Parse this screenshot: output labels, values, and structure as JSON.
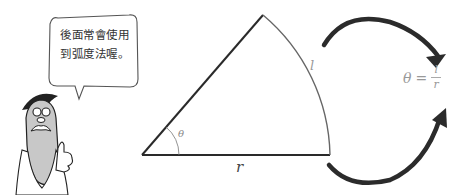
{
  "speech_bubble": {
    "line1": "後面常會使用",
    "line2": "到弧度法喔。"
  },
  "sector": {
    "angle_label": "θ",
    "arc_label": "l",
    "radius_label": "r"
  },
  "formula": {
    "lhs": "θ",
    "equals": "=",
    "numerator": "l",
    "denominator": "r"
  },
  "colors": {
    "line": "#2a2a2a",
    "arc": "#666666",
    "arrow": "#2b2b2b",
    "character_body": "#c8c8c8",
    "label": "#888888"
  }
}
